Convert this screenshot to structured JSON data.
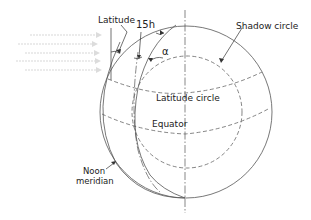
{
  "diagram": {
    "labels": {
      "latitude": "Latitude",
      "hour_angle": "15h",
      "alpha": "α",
      "shadow_circle": "Shadow circle",
      "latitude_circle": "Latitude circle",
      "equator": "Equator",
      "noon_meridian_line1": "Noon",
      "noon_meridian_line2": "meridian"
    },
    "elements": [
      "sphere-outline",
      "polar-axis",
      "shadow-circle",
      "latitude-circle",
      "equator",
      "noon-meridian",
      "hour-meridian",
      "sun-rays"
    ],
    "colors": {
      "line": "#555555",
      "text": "#222222",
      "sun_rays": "#d8d8d8"
    }
  }
}
